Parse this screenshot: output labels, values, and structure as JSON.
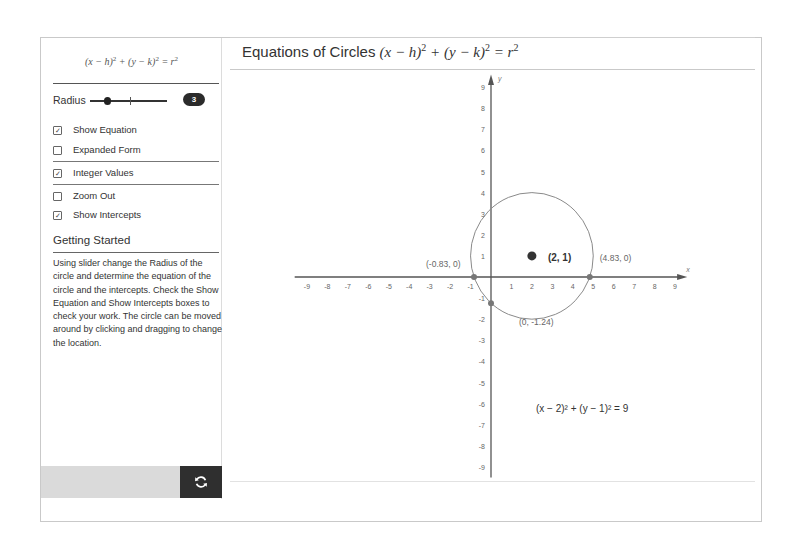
{
  "sidebar": {
    "formula": {
      "text": "(x − h)² + (y − k)² = r²",
      "lhs1": "(x − h)",
      "lhs2": " + (y − k)",
      "rhs": " = r",
      "exp": "2"
    },
    "radius": {
      "label": "Radius",
      "value": "3",
      "min": 1,
      "max": 10
    },
    "checkboxes": [
      {
        "label": "Show Equation",
        "checked": true,
        "mark": "✓"
      },
      {
        "label": "Expanded Form",
        "checked": false,
        "mark": ""
      },
      {
        "label": "Integer Values",
        "checked": true,
        "mark": "✓"
      },
      {
        "label": "Zoom Out",
        "checked": false,
        "mark": ""
      },
      {
        "label": "Show Intercepts",
        "checked": true,
        "mark": "✓"
      }
    ],
    "getting_started": {
      "title": "Getting Started",
      "text": "Using slider change the Radius of the circle and determine the equation of the circle and the intercepts. Check the Show Equation and Show Intercepts boxes to check your work. The circle can be moved around by clicking and dragging to change the location."
    },
    "reset_icon": "refresh-icon"
  },
  "main": {
    "title_text": "Equations of Circles",
    "title_math": {
      "p1": "(x − h)",
      "p2": " + (y − k)",
      "p3": " = r",
      "exp": "2"
    }
  },
  "graph": {
    "x_axis_label": "x",
    "y_axis_label": "y",
    "x_range": [
      -9,
      9
    ],
    "y_range": [
      -9,
      9
    ],
    "x_ticks": [
      "-9",
      "-8",
      "-7",
      "-6",
      "-5",
      "-4",
      "-3",
      "-2",
      "-1",
      "1",
      "2",
      "3",
      "4",
      "5",
      "6",
      "7",
      "8",
      "9"
    ],
    "y_ticks": [
      "9",
      "8",
      "7",
      "6",
      "5",
      "4",
      "3",
      "2",
      "1",
      "-1",
      "-2",
      "-3",
      "-4",
      "-5",
      "-6",
      "-7",
      "-8",
      "-9"
    ],
    "center": {
      "x": 2,
      "y": 1,
      "label": "(2, 1)"
    },
    "radius": 3,
    "intercepts": [
      {
        "x": -0.83,
        "y": 0,
        "label": "(-0.83, 0)"
      },
      {
        "x": 4.83,
        "y": 0,
        "label": "(4.83, 0)"
      },
      {
        "x": 0,
        "y": -1.24,
        "label": "(0, -1.24)"
      },
      {
        "x": 0,
        "y": 3.24,
        "label": ""
      }
    ],
    "equation": "(x − 2)² + (y − 1)² = 9",
    "colors": {
      "axis": "#555555",
      "circle": "#8a8a8a",
      "point": "#333333",
      "intercept": "#777777"
    }
  }
}
